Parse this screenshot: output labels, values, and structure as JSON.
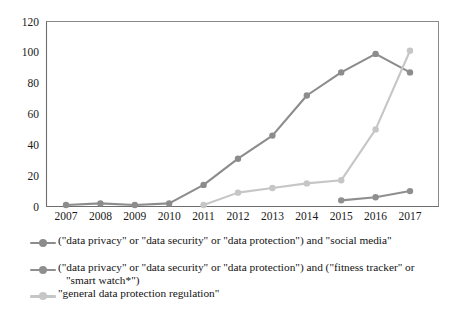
{
  "chart_data": {
    "type": "line",
    "title": "",
    "xlabel": "",
    "ylabel": "",
    "categories": [
      "2007",
      "2008",
      "2009",
      "2010",
      "2011",
      "2012",
      "2013",
      "2014",
      "2015",
      "2016",
      "2017"
    ],
    "ylim": [
      0,
      120
    ],
    "yticks": [
      0,
      20,
      40,
      60,
      80,
      100,
      120
    ],
    "grid": false,
    "legend_position": "bottom",
    "series": [
      {
        "name": "(\"data privacy\" or \"data security\" or \"data protection\") and \"social media\"",
        "color": "#8c8c8c",
        "values": [
          1,
          2,
          1,
          2,
          14,
          31,
          46,
          72,
          87,
          99,
          87
        ]
      },
      {
        "name": "(\"data privacy\" or \"data security\" or \"data protection\") and (\"fitness tracker\" or \"smart watch*\")",
        "color": "#8f8f8f",
        "values": [
          null,
          null,
          null,
          null,
          null,
          null,
          null,
          null,
          4,
          6,
          10
        ]
      },
      {
        "name": "\"general data protection regulation\"",
        "color": "#c6c6c6",
        "values": [
          null,
          null,
          null,
          null,
          1,
          9,
          12,
          15,
          17,
          50,
          101
        ]
      }
    ]
  },
  "legend": {
    "entries": [
      {
        "line1": "(\"data privacy\" or \"data security\" or \"data protection\") and \"social media\"",
        "line2": ""
      },
      {
        "line1": "(\"data privacy\" or \"data security\" or \"data protection\") and (\"fitness tracker\" or",
        "line2": "\"smart watch*\")"
      },
      {
        "line1": "\"general data protection regulation\"",
        "line2": ""
      }
    ]
  },
  "colors": {
    "series1": "#8c8c8c",
    "series2": "#8f8f8f",
    "series3": "#c6c6c6",
    "axis": "#6e6e6e",
    "border": "#8a8a8a",
    "text": "#131313"
  }
}
